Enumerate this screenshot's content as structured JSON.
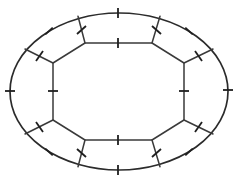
{
  "figure": {
    "title": "Oval arena plan with segmented perimeter",
    "background_color": "#ffffff",
    "line_color": "#2b2b2b",
    "width": 238,
    "height": 184
  },
  "chart_data": {
    "type": "diagram",
    "title": "Oval arena plan with segmented perimeter",
    "center": {
      "x": 119,
      "y": 91.5
    },
    "outer_ellipse": {
      "rx": 109,
      "ry": 78.5,
      "stroke": "#2b2b2b"
    },
    "inner_polygon": {
      "shape": "octagon",
      "vertices": [
        {
          "x": 85,
          "y": 43
        },
        {
          "x": 152,
          "y": 43
        },
        {
          "x": 184,
          "y": 63
        },
        {
          "x": 184,
          "y": 120
        },
        {
          "x": 152,
          "y": 140
        },
        {
          "x": 85,
          "y": 140
        },
        {
          "x": 53,
          "y": 120
        },
        {
          "x": 53,
          "y": 63
        }
      ]
    },
    "spokes": [
      {
        "name": "spoke-top-left",
        "from": {
          "x": 85,
          "y": 43
        },
        "to": {
          "x": 78,
          "y": 16.3
        }
      },
      {
        "name": "spoke-top-right",
        "from": {
          "x": 152,
          "y": 43
        },
        "to": {
          "x": 160,
          "y": 16.3
        }
      },
      {
        "name": "spoke-right-upper",
        "from": {
          "x": 184,
          "y": 63
        },
        "to": {
          "x": 213,
          "y": 49
        }
      },
      {
        "name": "spoke-right-lower",
        "from": {
          "x": 184,
          "y": 120
        },
        "to": {
          "x": 213,
          "y": 134
        }
      },
      {
        "name": "spoke-bottom-right",
        "from": {
          "x": 152,
          "y": 140
        },
        "to": {
          "x": 160,
          "y": 166.7
        }
      },
      {
        "name": "spoke-bottom-left",
        "from": {
          "x": 85,
          "y": 140
        },
        "to": {
          "x": 78,
          "y": 166.7
        }
      },
      {
        "name": "spoke-left-lower",
        "from": {
          "x": 53,
          "y": 120
        },
        "to": {
          "x": 25,
          "y": 134
        }
      },
      {
        "name": "spoke-left-upper",
        "from": {
          "x": 53,
          "y": 63
        },
        "to": {
          "x": 25,
          "y": 49
        }
      }
    ],
    "panel_count": 8,
    "tick_marks": {
      "count": 20,
      "groups": [
        {
          "name": "outer-arc-ticks",
          "count": 8
        },
        {
          "name": "inner-edge-ticks",
          "count": 4
        },
        {
          "name": "spoke-ticks",
          "count": 8
        }
      ]
    },
    "outer_ticks": [
      {
        "name": "tick-outer-top",
        "x": 118,
        "y": 13,
        "angle": 90
      },
      {
        "name": "tick-outer-bottom",
        "x": 118,
        "y": 170,
        "angle": 90
      },
      {
        "name": "tick-outer-left",
        "x": 10,
        "y": 91,
        "angle": 0
      },
      {
        "name": "tick-outer-right",
        "x": 228,
        "y": 90,
        "angle": 0
      },
      {
        "name": "tick-outer-upper-left",
        "x": 49,
        "y": 31,
        "angle": 42
      },
      {
        "name": "tick-outer-upper-right",
        "x": 189,
        "y": 31,
        "angle": -42
      },
      {
        "name": "tick-outer-lower-left",
        "x": 49,
        "y": 152,
        "angle": -42
      },
      {
        "name": "tick-outer-lower-right",
        "x": 189,
        "y": 152,
        "angle": 42
      }
    ],
    "inner_ticks": [
      {
        "name": "tick-inner-top",
        "x": 118,
        "y": 43,
        "angle": 90
      },
      {
        "name": "tick-inner-bottom",
        "x": 118,
        "y": 140,
        "angle": 90
      },
      {
        "name": "tick-inner-left",
        "x": 53,
        "y": 91,
        "angle": 0
      },
      {
        "name": "tick-inner-right",
        "x": 184,
        "y": 91,
        "angle": 0
      }
    ],
    "grid": false,
    "legend": null,
    "axis_labels": null
  }
}
